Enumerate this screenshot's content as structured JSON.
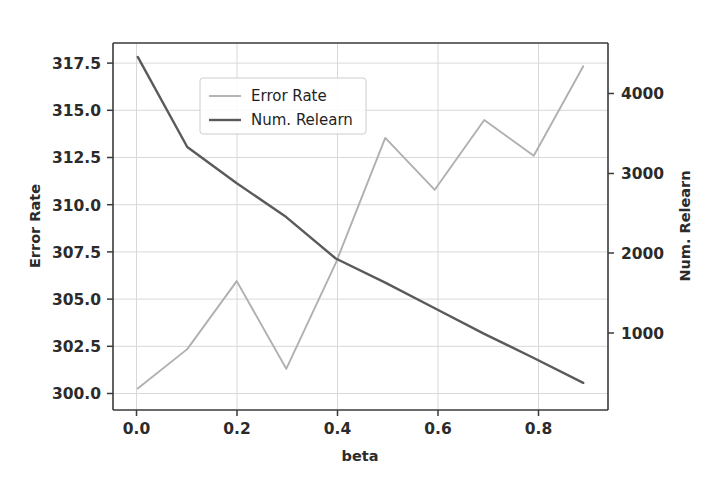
{
  "chart_data": {
    "type": "line",
    "title": "",
    "xlabel": "beta",
    "ylabel": "Error Rate",
    "ylabel_right": "Num. Relearn",
    "x": [
      0.0,
      0.1,
      0.2,
      0.3,
      0.4,
      0.5,
      0.6,
      0.7,
      0.8,
      0.9
    ],
    "series": [
      {
        "name": "Error Rate",
        "axis": "left",
        "color": "#b0b0b0",
        "values": [
          300.0,
          302.2,
          306.0,
          301.1,
          307.0,
          314.0,
          311.1,
          315.0,
          313.0,
          318.0
        ]
      },
      {
        "name": "Num. Relearn",
        "axis": "right",
        "color": "#5a5a5a",
        "values": [
          4575,
          3380,
          2900,
          2450,
          1900,
          1580,
          1240,
          900,
          580,
          250
        ]
      }
    ],
    "xlim": [
      -0.05,
      0.95
    ],
    "ylim_left": [
      298.8,
      319.3
    ],
    "ylim_right": [
      -110,
      4760
    ],
    "xticks": [
      0.0,
      0.2,
      0.4,
      0.6,
      0.8
    ],
    "xtick_labels": [
      "0.0",
      "0.2",
      "0.4",
      "0.6",
      "0.8"
    ],
    "yticks_left": [
      300.0,
      302.5,
      305.0,
      307.5,
      310.0,
      312.5,
      315.0,
      317.5
    ],
    "ytick_labels_left": [
      "300.0",
      "302.5",
      "305.0",
      "307.5",
      "310.0",
      "312.5",
      "315.0",
      "317.5"
    ],
    "yticks_right": [
      1000,
      2000,
      3000,
      4000
    ],
    "ytick_labels_right": [
      "1000",
      "2000",
      "3000",
      "4000"
    ],
    "grid": true,
    "legend_position": "upper center-left",
    "legend_entries": [
      "Error Rate",
      "Num. Relearn"
    ]
  },
  "axes": {
    "x_title": "beta",
    "y_left_title": "Error Rate",
    "y_right_title": "Num. Relearn"
  },
  "legend": {
    "items": [
      {
        "label": "Error Rate"
      },
      {
        "label": "Num. Relearn"
      }
    ]
  },
  "colors": {
    "error_rate": "#b0b0b0",
    "num_relearn": "#5a5a5a",
    "grid": "#d8d8d8",
    "spine": "#3a3a3a",
    "text": "#2b2b2b",
    "background": "#ffffff"
  },
  "plot_box": {
    "left": 113,
    "right": 608,
    "top": 43,
    "bottom": 410
  }
}
